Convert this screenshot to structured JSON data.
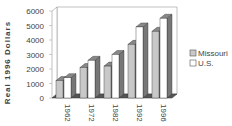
{
  "chart_data": {
    "type": "bar",
    "title": "",
    "xlabel": "",
    "ylabel": "Real 1996 Dollars",
    "ylim": [
      0,
      6000
    ],
    "yticks": [
      0,
      1000,
      2000,
      3000,
      4000,
      5000,
      6000
    ],
    "categories": [
      "1962",
      "1972",
      "1982",
      "1992",
      "1996"
    ],
    "series": [
      {
        "name": "Missouri",
        "values": [
          1200,
          2100,
          2200,
          3700,
          4600
        ],
        "color": "#c8c8c8"
      },
      {
        "name": "U.S.",
        "values": [
          1400,
          2600,
          3000,
          4900,
          5500
        ],
        "color": "#ffffff"
      }
    ],
    "legend_position": "right",
    "grid": false,
    "style": "3d"
  }
}
